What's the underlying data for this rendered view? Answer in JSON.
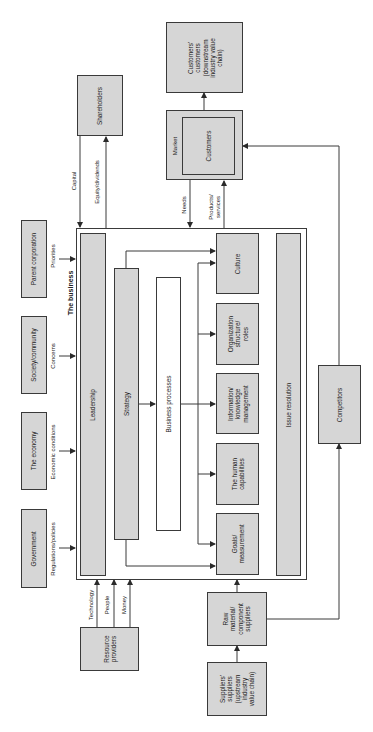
{
  "diagram": {
    "orientation": "rotated-90-ccw",
    "business": {
      "title": "The business",
      "components": {
        "leadership": "Leadership",
        "strategy": "Strategy",
        "business_processes": "Business processes",
        "culture": "Culture",
        "organization": "Organization\nstructure/\nroles",
        "information": "Information/\nknowledge\nmanagement",
        "human": "The human\ncapabilities",
        "goals": "Goals/\nmeasurement",
        "issue_resolution": "Issue resolution"
      }
    },
    "external": {
      "parent_corporation": "Parent corporation",
      "society": "Society/community",
      "economy": "The economy",
      "government": "Government",
      "shareholders": "Shareholders",
      "market": "Market",
      "customers": "Customers",
      "customers_customers": "Customers'\ncustomers\n(downstream\nindustry value\nchain)",
      "resource_providers": "Resource\nproviders",
      "raw_material": "Raw\nmaterial/\ncomponent\nsuppliers",
      "suppliers_suppliers": "Suppliers'\nsuppliers\n(upstream\nindustry\nvalue chain)",
      "competitors": "Competitors"
    },
    "flows": {
      "priorities": "Priorities",
      "concerns": "Concerns",
      "economic_conditions": "Economic conditions",
      "regulations": "Regulations/policies",
      "capital": "Capital",
      "equity": "Equity/dividends",
      "needs": "Needs",
      "products": "Products/\nservices",
      "technology": "Technology",
      "people": "People",
      "money": "Money"
    },
    "colors": {
      "box_fill": "#d6d6d6",
      "line": "#3a3a3a",
      "background": "#ffffff"
    }
  }
}
